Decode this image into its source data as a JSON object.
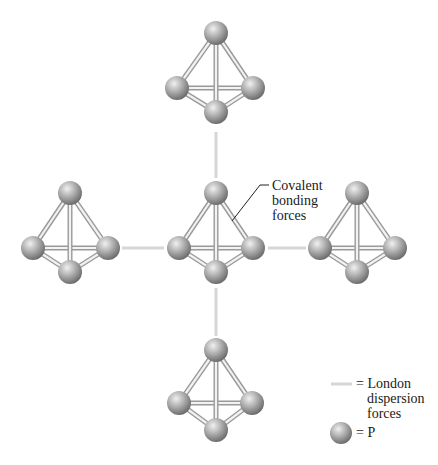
{
  "diagram": {
    "type": "molecular-structure",
    "colors": {
      "sphere_light": "#e8e8e8",
      "sphere_mid": "#a8a8a8",
      "sphere_dark": "#6e6e6e",
      "bond_outline": "#9a9a9a",
      "bond_fill": "#f2f2f2",
      "london_line": "#d6d6d6",
      "text": "#1a1a1a"
    },
    "molecules": [
      {
        "id": "top",
        "apex": [
          216,
          33
        ],
        "left": [
          177,
          88
        ],
        "right": [
          253,
          88
        ],
        "bottom": [
          216,
          112
        ]
      },
      {
        "id": "left",
        "apex": [
          70,
          193
        ],
        "left": [
          33,
          248
        ],
        "right": [
          108,
          248
        ],
        "bottom": [
          70,
          272
        ]
      },
      {
        "id": "center",
        "apex": [
          216,
          193
        ],
        "left": [
          179,
          248
        ],
        "right": [
          253,
          248
        ],
        "bottom": [
          216,
          272
        ]
      },
      {
        "id": "right",
        "apex": [
          357,
          193
        ],
        "left": [
          320,
          248
        ],
        "right": [
          395,
          248
        ],
        "bottom": [
          357,
          272
        ]
      },
      {
        "id": "bottom",
        "apex": [
          216,
          350
        ],
        "left": [
          179,
          403
        ],
        "right": [
          252,
          403
        ],
        "bottom": [
          216,
          430
        ]
      }
    ],
    "london_forces": [
      {
        "from": [
          216,
          132
        ],
        "to": [
          216,
          178
        ]
      },
      {
        "from": [
          122,
          248
        ],
        "to": [
          164,
          248
        ]
      },
      {
        "from": [
          268,
          248
        ],
        "to": [
          306,
          248
        ]
      },
      {
        "from": [
          216,
          288
        ],
        "to": [
          216,
          336
        ]
      }
    ],
    "annotation": {
      "lines": [
        "Covalent",
        "bonding",
        "forces"
      ]
    },
    "legend": {
      "london_symbol_label": "=",
      "london_lines": [
        "London",
        "dispersion",
        "forces"
      ],
      "atom_symbol_label": "=",
      "atom_label": "P"
    }
  }
}
